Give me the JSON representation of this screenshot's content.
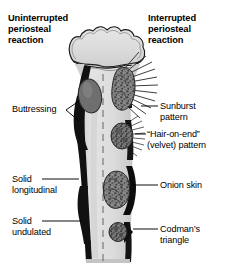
{
  "figure": {
    "background_color": "#ffffff",
    "ink_color": "#000000"
  },
  "headers": {
    "left": {
      "text": "Uninterrupted\nperiosteal\nreaction",
      "lines": [
        "Uninterrupted",
        "periosteal",
        "reaction"
      ]
    },
    "right": {
      "text": "Interrupted\nperiosteal\nreaction",
      "lines": [
        "Interrupted",
        "periosteal",
        "reaction"
      ]
    }
  },
  "labels": {
    "left": [
      {
        "id": "buttressing",
        "text": "Buttressing",
        "leader": "v-bracket"
      },
      {
        "id": "solid-longitudinal",
        "text": "Solid\nlongitudinal",
        "leader": "line"
      },
      {
        "id": "solid-undulated",
        "text": "Solid\nundulated",
        "leader": "line"
      }
    ],
    "right": [
      {
        "id": "sunburst",
        "text": "Sunburst\npattern",
        "leader": "line"
      },
      {
        "id": "hair-on-end",
        "text": "“Hair-on-end”\n(velvet) pattern",
        "leader": "line"
      },
      {
        "id": "onion-skin",
        "text": "Onion skin",
        "leader": "line"
      },
      {
        "id": "codmans-triangle",
        "text": "Codman’s\ntriangle",
        "leader": "line"
      }
    ]
  },
  "bone": {
    "name": "long bone with epiphysis and diaphysis",
    "medulla_color": "#d9d9d9",
    "epiphysis_color": "#dcdcdc",
    "cortex_color": "#111111",
    "lesion_color": "#6e6e6e",
    "midline": "dashed"
  },
  "lesions": [
    {
      "id": "buttressing-mass",
      "label": "Buttressing",
      "style": "smooth-gray-oval"
    },
    {
      "id": "sunburst-mass",
      "label": "Sunburst pattern",
      "style": "textured-with-radiating-spicules"
    },
    {
      "id": "hair-on-end-mass",
      "label": "“Hair-on-end” (velvet) pattern",
      "style": "round-textured-with-fine-hairs"
    },
    {
      "id": "onion-skin-mass",
      "label": "Onion skin",
      "style": "textured-lobulated-on-dark-cortex"
    },
    {
      "id": "codmans-triangle-mass",
      "label": "Codman’s triangle",
      "style": "small-dark-wedge"
    }
  ]
}
